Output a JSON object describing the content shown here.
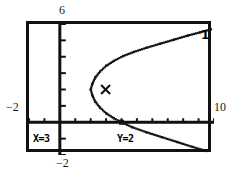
{
  "screen": {
    "device": "graphing-calculator",
    "frame_color": "#111111",
    "background": "#ffffff"
  },
  "axis_labels": {
    "top": "6",
    "left": "−2",
    "right": "10",
    "bottom": "−2"
  },
  "readouts": {
    "x_label": "X=3",
    "y_label": "Y=2"
  },
  "annotations": {
    "curve_label": "1"
  },
  "chart_data": {
    "type": "line",
    "title": "",
    "xlabel": "",
    "ylabel": "",
    "xlim": [
      -2,
      10
    ],
    "ylim": [
      -2,
      6
    ],
    "xtick_step": 1,
    "ytick_step": 1,
    "grid": false,
    "legend": "none",
    "curve_name": "1",
    "trace_cursor": {
      "x": 3,
      "y": 2,
      "marker": "x"
    },
    "axis_intercept_marker": {
      "x": 4,
      "y": 0
    },
    "series": [
      {
        "name": "upper-branch",
        "points": [
          [
            2.0,
            2.0
          ],
          [
            2.1,
            2.35
          ],
          [
            2.3,
            2.75
          ],
          [
            2.6,
            3.1
          ],
          [
            3.0,
            3.45
          ],
          [
            3.5,
            3.75
          ],
          [
            4.1,
            4.05
          ],
          [
            4.8,
            4.3
          ],
          [
            5.6,
            4.55
          ],
          [
            6.5,
            4.8
          ],
          [
            7.4,
            5.05
          ],
          [
            8.3,
            5.3
          ],
          [
            9.1,
            5.5
          ],
          [
            9.8,
            5.68
          ]
        ]
      },
      {
        "name": "lower-branch",
        "points": [
          [
            2.0,
            2.0
          ],
          [
            2.1,
            1.65
          ],
          [
            2.3,
            1.25
          ],
          [
            2.6,
            0.9
          ],
          [
            3.0,
            0.55
          ],
          [
            3.5,
            0.25
          ],
          [
            4.0,
            0.0
          ],
          [
            4.7,
            -0.3
          ],
          [
            5.6,
            -0.6
          ],
          [
            6.6,
            -0.9
          ],
          [
            7.6,
            -1.2
          ],
          [
            8.6,
            -1.5
          ],
          [
            9.5,
            -1.75
          ]
        ]
      }
    ]
  }
}
